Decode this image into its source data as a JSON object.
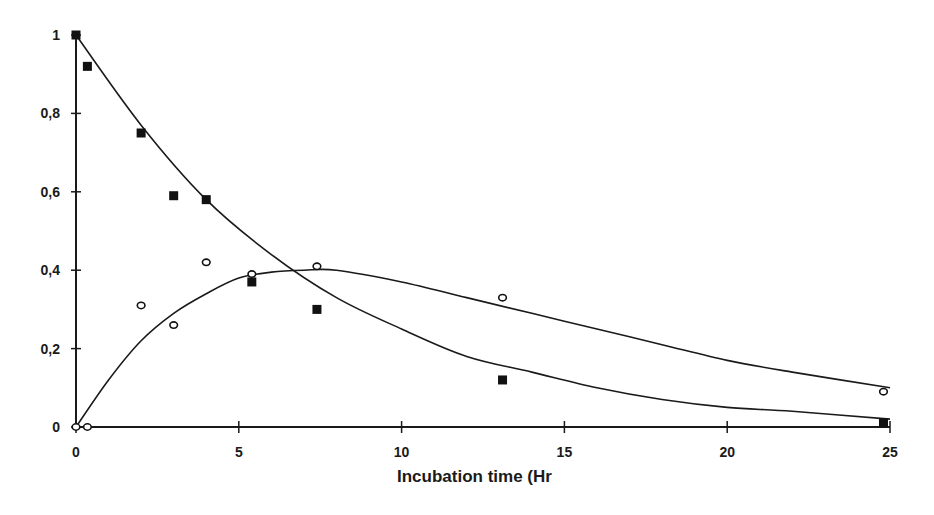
{
  "chart_data": {
    "type": "scatter",
    "title": "",
    "xlabel": "Incubation time (Hr",
    "ylabel": "",
    "xlim": [
      0,
      25
    ],
    "ylim": [
      0,
      1
    ],
    "grid": false,
    "legend": null,
    "x_ticks": [
      "0",
      "5",
      "10",
      "15",
      "20",
      "25"
    ],
    "y_ticks": [
      "0",
      "0,2",
      "0,4",
      "0,6",
      "0,8",
      "1"
    ],
    "series": [
      {
        "name": "filled-squares",
        "marker": "square-filled",
        "x": [
          0,
          0.35,
          2.0,
          3.0,
          4.0,
          5.4,
          7.4,
          13.1,
          24.8
        ],
        "y": [
          1.0,
          0.92,
          0.75,
          0.59,
          0.58,
          0.37,
          0.3,
          0.12,
          0.01
        ],
        "fit_curve": "exponential decay",
        "fit_x": [
          0,
          2,
          4,
          6,
          8,
          10,
          12,
          14,
          16,
          18,
          20,
          22,
          25
        ],
        "fit_y": [
          1.0,
          0.77,
          0.58,
          0.44,
          0.33,
          0.25,
          0.18,
          0.14,
          0.1,
          0.07,
          0.05,
          0.04,
          0.02
        ]
      },
      {
        "name": "open-circles",
        "marker": "circle-open",
        "x": [
          0,
          0.35,
          2.0,
          3.0,
          4.0,
          5.4,
          7.4,
          13.1,
          24.8
        ],
        "y": [
          0.0,
          0.0,
          0.31,
          0.26,
          0.42,
          0.39,
          0.41,
          0.33,
          0.09
        ],
        "fit_curve": "rise then decay",
        "fit_x": [
          0,
          1,
          2,
          3,
          4,
          5,
          6,
          7,
          8,
          10,
          12,
          14,
          16,
          18,
          20,
          22,
          25
        ],
        "fit_y": [
          0.0,
          0.12,
          0.22,
          0.29,
          0.34,
          0.38,
          0.395,
          0.4,
          0.4,
          0.37,
          0.33,
          0.29,
          0.25,
          0.21,
          0.17,
          0.14,
          0.1
        ]
      }
    ]
  }
}
